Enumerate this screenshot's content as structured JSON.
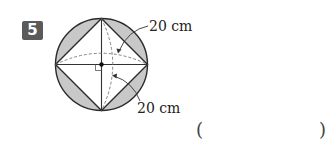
{
  "problem": {
    "number": "5",
    "labels": {
      "top_dimension": "20 cm",
      "bottom_dimension": "20 cm"
    },
    "answer": {
      "open_paren": "(",
      "close_paren": ")",
      "value": ""
    }
  },
  "colors": {
    "badge_bg": "#5a5a5a",
    "shaded_region": "#c8c8c8",
    "stroke": "#333333",
    "dashed": "#777777"
  }
}
